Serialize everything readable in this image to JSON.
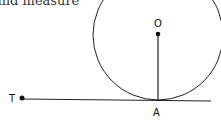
{
  "caption": "and measure",
  "diagram": {
    "labels": {
      "center": "O",
      "tangent_point": "A",
      "external_point": "T"
    },
    "circle": {
      "cx": 158,
      "cy": 36,
      "r": 65
    },
    "points": {
      "O": {
        "x": 158,
        "y": 34
      },
      "A": {
        "x": 158,
        "y": 101
      },
      "T": {
        "x": 22,
        "y": 98
      }
    },
    "stroke_color": "#222222"
  }
}
